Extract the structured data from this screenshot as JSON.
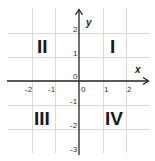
{
  "diagram": {
    "axes": {
      "x_label": "x",
      "y_label": "y",
      "x_ticks": [
        "-2",
        "-1",
        "0",
        "1",
        "2"
      ],
      "y_ticks": [
        "2",
        "1",
        "0",
        "-1",
        "-2",
        "-3"
      ]
    },
    "quadrants": {
      "q1": "I",
      "q2": "II",
      "q3": "III",
      "q4": "IV"
    },
    "colors": {
      "grid": "#d9d9d9",
      "axis": "#222222",
      "text": "#1a1a1a"
    }
  }
}
